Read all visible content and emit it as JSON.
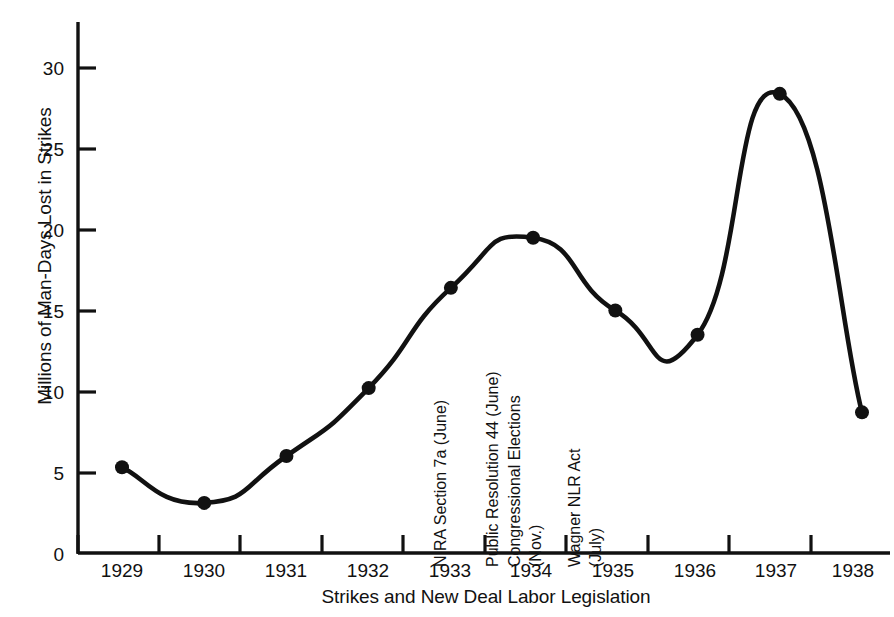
{
  "chart_data": {
    "type": "line",
    "title": "",
    "subtitle": "",
    "xlabel": "Strikes and New Deal Labor Legislation",
    "ylabel": "Millions of Man-Days Lost in Strikes",
    "categories": [
      "1929",
      "1930",
      "1931",
      "1932",
      "1933",
      "1934",
      "1935",
      "1936",
      "1937",
      "1938"
    ],
    "x": [
      1929,
      1930,
      1931,
      1932,
      1933,
      1934,
      1935,
      1936,
      1937,
      1938
    ],
    "values": [
      5.3,
      3.1,
      6.0,
      10.2,
      16.4,
      19.5,
      15.0,
      13.5,
      28.4,
      8.7
    ],
    "series": [
      {
        "name": "Millions of Man-Days Lost in Strikes",
        "values": [
          5.3,
          3.1,
          6.0,
          10.2,
          16.4,
          19.5,
          15.0,
          13.5,
          28.4,
          8.7
        ]
      }
    ],
    "xlim": [
      1929,
      1938
    ],
    "ylim": [
      0,
      30
    ],
    "ytick_labels": [
      "0",
      "5",
      "10",
      "15",
      "20",
      "25",
      "30"
    ],
    "ytick_values": [
      0,
      5,
      10,
      15,
      20,
      25,
      30
    ],
    "xtick_labels": [
      "1929",
      "1930",
      "1931",
      "1932",
      "1933",
      "1934",
      "1935",
      "1936",
      "1937",
      "1938"
    ],
    "grid": false,
    "legend": false,
    "legend_position": "none",
    "line_color": "#111111",
    "marker_color": "#111111",
    "marker_shape": "circle",
    "background_color": "#ffffff",
    "annotations": [
      {
        "text": "NIRA Section 7a (June)",
        "x": 1933.1,
        "orientation": "vertical"
      },
      {
        "text": "Public Resolution 44 (June)",
        "x": 1933.7,
        "orientation": "vertical"
      },
      {
        "text": "Congressional Elections (Nov.)",
        "x": 1934.05,
        "orientation": "vertical"
      },
      {
        "text": "Wagner NLR Act (July)",
        "x": 1934.7,
        "orientation": "vertical"
      }
    ]
  },
  "axis": {
    "y_title": "Millions of Man-Days Lost in Strikes",
    "x_title": "Strikes and New Deal Labor Legislation",
    "y_ticks": [
      {
        "label": "30"
      },
      {
        "label": "25"
      },
      {
        "label": "20"
      },
      {
        "label": "15"
      },
      {
        "label": "10"
      },
      {
        "label": "5"
      },
      {
        "label": "0"
      }
    ],
    "x_ticks": [
      {
        "label": "1929"
      },
      {
        "label": "1930"
      },
      {
        "label": "1931"
      },
      {
        "label": "1932"
      },
      {
        "label": "1933"
      },
      {
        "label": "1934"
      },
      {
        "label": "1935"
      },
      {
        "label": "1936"
      },
      {
        "label": "1937"
      },
      {
        "label": "1938"
      }
    ]
  },
  "annotations": [
    {
      "line1": "NIRA Section 7a (June)",
      "line2": ""
    },
    {
      "line1": "Public Resolution 44 (June)",
      "line2": ""
    },
    {
      "line1": "Congressional Elections",
      "line2": "(Nov.)"
    },
    {
      "line1": "Wagner NLR Act",
      "line2": "(July)"
    }
  ],
  "annotation_text": {
    "nira": "NIRA Section 7a (June)",
    "public_resolution": "Public Resolution 44 (June)",
    "congressional_elections": "Congressional Elections",
    "congressional_elections_month": "(Nov.)",
    "wagner": "Wagner NLR Act",
    "wagner_month": "(July)"
  }
}
